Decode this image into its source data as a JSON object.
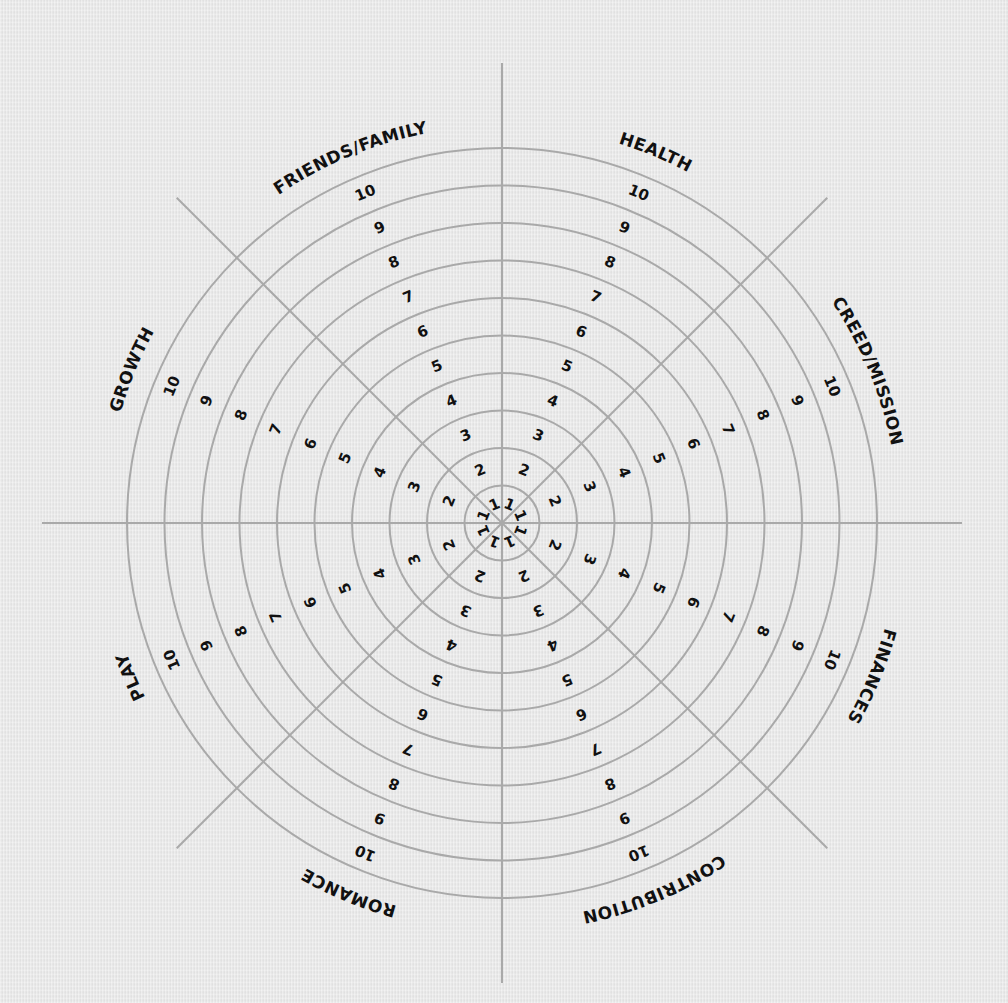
{
  "wheel": {
    "title": "",
    "center": [
      502,
      523
    ],
    "ring_count": 10,
    "ring_spacing": 37.5,
    "axis_half_length_straight": 460,
    "axis_half_length_diagonal": 460,
    "colors": {
      "background": "#e6e6e6",
      "lines": "#a9a9a9",
      "text": "#111111"
    },
    "segments": [
      {
        "label": "HEALTH",
        "angle": 22.5
      },
      {
        "label": "CREED/MISSION",
        "angle": 67.5
      },
      {
        "label": "FINANCES",
        "angle": 112.5
      },
      {
        "label": "CONTRIBUTION",
        "angle": 157.5
      },
      {
        "label": "ROMANCE",
        "angle": 202.5
      },
      {
        "label": "PLAY",
        "angle": 247.5
      },
      {
        "label": "GROWTH",
        "angle": 292.5
      },
      {
        "label": "FRIENDS/FAMILY",
        "angle": 337.5
      }
    ],
    "scale_labels": [
      "1",
      "2",
      "3",
      "4",
      "5",
      "6",
      "7",
      "8",
      "9",
      "10"
    ]
  },
  "chart_data": {
    "type": "radial-wheel",
    "title": "",
    "categories": [
      "HEALTH",
      "CREED/MISSION",
      "FINANCES",
      "CONTRIBUTION",
      "ROMANCE",
      "PLAY",
      "GROWTH",
      "FRIENDS/FAMILY"
    ],
    "scale": {
      "min": 1,
      "max": 10,
      "ticks": [
        1,
        2,
        3,
        4,
        5,
        6,
        7,
        8,
        9,
        10
      ]
    },
    "rings": 10,
    "spokes": 8,
    "grid": true,
    "values": null
  }
}
